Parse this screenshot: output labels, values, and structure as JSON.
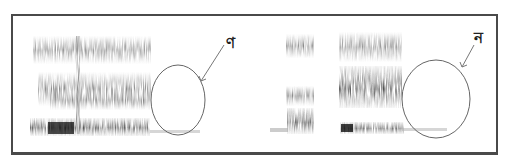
{
  "figure": {
    "type": "spectrogram-comparison",
    "segments": [
      {
        "id": "left",
        "x": [
          32,
          150
        ],
        "description": "spectrogram with formant bands, followed by a circled gap"
      },
      {
        "id": "middle",
        "x": [
          285,
          314
        ],
        "description": "narrow spectrogram burst"
      },
      {
        "id": "right",
        "x": [
          340,
          402
        ],
        "description": "spectrogram with formant bands, followed by a circled gap"
      }
    ],
    "annotations": [
      {
        "label": "ণ",
        "circle": {
          "cx": 178,
          "cy": 100,
          "rx": 27,
          "ry": 35
        },
        "arrow_from": [
          224,
          45
        ],
        "arrow_to": [
          201,
          81
        ]
      },
      {
        "label": "ন",
        "circle": {
          "cx": 436,
          "cy": 99,
          "rx": 34,
          "ry": 39
        },
        "arrow_from": [
          474,
          45
        ],
        "arrow_to": [
          462,
          67
        ]
      }
    ],
    "colors": {
      "frame": "#4a4a4a",
      "ink": "#222222",
      "circle": "#666666"
    }
  }
}
